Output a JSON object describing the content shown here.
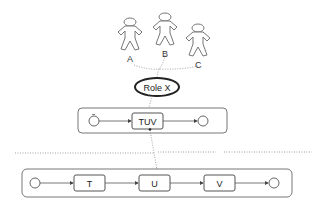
{
  "actors": [
    {
      "label": "A"
    },
    {
      "label": "B"
    },
    {
      "label": "C"
    }
  ],
  "role": {
    "label": "Role X"
  },
  "upper_process": {
    "tasks": [
      {
        "label": "TUV"
      }
    ]
  },
  "lower_process": {
    "tasks": [
      {
        "label": "T"
      },
      {
        "label": "U"
      },
      {
        "label": "V"
      }
    ]
  },
  "colors": {
    "stroke": "#555555",
    "role_outline": "#222222",
    "background": "#ffffff"
  }
}
